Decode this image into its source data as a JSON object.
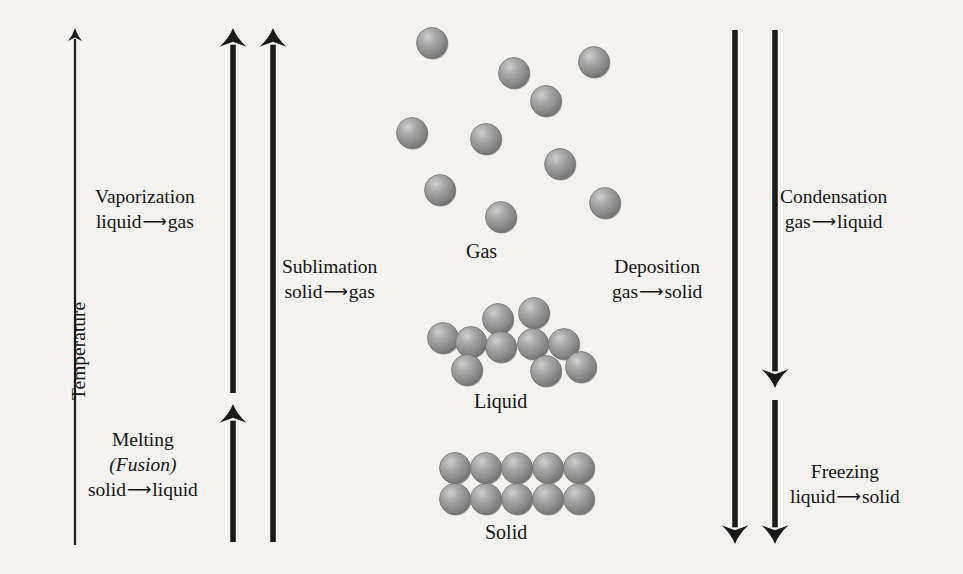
{
  "figure": {
    "kind": "phase-change-diagram",
    "background_color": "#f3f2ef",
    "ink_color": "#1a1a1a",
    "molecule_color": "#8f8f8f",
    "molecule_highlight": "#d8d8d8",
    "molecule_shadow": "#636363"
  },
  "axis": {
    "label": "Temperature",
    "direction": "up"
  },
  "transitions": {
    "vaporization": {
      "name": "Vaporization",
      "from": "liquid",
      "arrow": "⟶",
      "to": "gas",
      "direction": "up"
    },
    "melting": {
      "name": "Melting",
      "alt_name": "(Fusion)",
      "alt_name_plain": "Fusion",
      "from": "solid",
      "arrow": "⟶",
      "to": "liquid",
      "direction": "up"
    },
    "sublimation": {
      "name": "Sublimation",
      "from": "solid",
      "arrow": "⟶",
      "to": "gas",
      "direction": "up"
    },
    "deposition": {
      "name": "Deposition",
      "from": "gas",
      "arrow": "⟶",
      "to": "solid",
      "direction": "down"
    },
    "condensation": {
      "name": "Condensation",
      "from": "gas",
      "arrow": "⟶",
      "to": "liquid",
      "direction": "down"
    },
    "freezing": {
      "name": "Freezing",
      "from": "liquid",
      "arrow": "⟶",
      "to": "solid",
      "direction": "down"
    }
  },
  "phases": {
    "gas": {
      "label": "Gas",
      "molecule_count": 10,
      "arrangement": "far apart, random",
      "molecules": [
        {
          "cx": 432,
          "cy": 43
        },
        {
          "cx": 514,
          "cy": 73
        },
        {
          "cx": 594,
          "cy": 62
        },
        {
          "cx": 546,
          "cy": 101
        },
        {
          "cx": 412,
          "cy": 133
        },
        {
          "cx": 486,
          "cy": 139
        },
        {
          "cx": 560,
          "cy": 164
        },
        {
          "cx": 440,
          "cy": 190
        },
        {
          "cx": 501,
          "cy": 217
        },
        {
          "cx": 605,
          "cy": 203
        }
      ]
    },
    "liquid": {
      "label": "Liquid",
      "molecule_count": 10,
      "arrangement": "touching, disordered",
      "molecules": [
        {
          "cx": 498,
          "cy": 319
        },
        {
          "cx": 534,
          "cy": 313
        },
        {
          "cx": 443,
          "cy": 338
        },
        {
          "cx": 471,
          "cy": 342
        },
        {
          "cx": 501,
          "cy": 347
        },
        {
          "cx": 533,
          "cy": 344
        },
        {
          "cx": 564,
          "cy": 344
        },
        {
          "cx": 467,
          "cy": 370
        },
        {
          "cx": 546,
          "cy": 371
        },
        {
          "cx": 581,
          "cy": 367
        }
      ]
    },
    "solid": {
      "label": "Solid",
      "molecule_count": 10,
      "arrangement": "ordered lattice, 5 columns x 2 rows",
      "lattice": {
        "columns": 5,
        "rows": 2,
        "x_start": 455,
        "y_start": 468,
        "spacing": 31
      }
    }
  },
  "molecule": {
    "radius": 15.5,
    "icon": "sphere-icon"
  },
  "label_positions": {
    "axis_temperature": {
      "x": 68,
      "y": 400
    },
    "vaporization": {
      "x": 95,
      "y": 185
    },
    "melting": {
      "x": 88,
      "y": 428
    },
    "sublimation": {
      "x": 282,
      "y": 255
    },
    "deposition": {
      "x": 612,
      "y": 255
    },
    "condensation": {
      "x": 780,
      "y": 185
    },
    "freezing": {
      "x": 790,
      "y": 460
    },
    "gas": {
      "x": 466,
      "y": 240
    },
    "liquid": {
      "x": 474,
      "y": 390
    },
    "solid": {
      "x": 485,
      "y": 521
    }
  },
  "arrows": {
    "temperature_axis": {
      "x": 75,
      "top": 28,
      "bottom": 545,
      "width": 2.2,
      "head": "top"
    },
    "vaporization": {
      "x": 233,
      "top": 28,
      "bottom": 393,
      "width": 5.5,
      "head": "top"
    },
    "melting": {
      "x": 233,
      "top": 404,
      "bottom": 542,
      "width": 5.5,
      "head": "top"
    },
    "sublimation": {
      "x": 273,
      "top": 28,
      "bottom": 542,
      "width": 5.5,
      "head": "top"
    },
    "deposition": {
      "x": 735,
      "top": 30,
      "bottom": 544,
      "width": 5.5,
      "head": "bottom"
    },
    "condensation": {
      "x": 775,
      "top": 30,
      "bottom": 388,
      "width": 5.5,
      "head": "bottom"
    },
    "freezing": {
      "x": 775,
      "top": 400,
      "bottom": 544,
      "width": 5.5,
      "head": "bottom"
    }
  }
}
